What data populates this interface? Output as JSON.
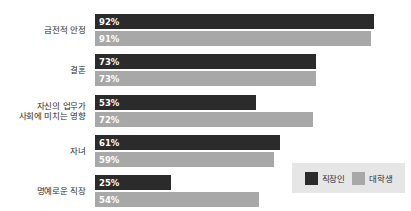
{
  "chart_data": {
    "type": "bar",
    "orientation": "horizontal",
    "title": "",
    "subtitle": "",
    "xlabel": "",
    "ylabel": "",
    "grid": false,
    "xlim": [
      0,
      100
    ],
    "legend_position": "bottom-right",
    "categories": [
      "금전적 안정",
      "자신의 업무가\n사회에 미치는 영향",
      "결혼",
      "자녀",
      "명예로운 직장"
    ],
    "series": [
      {
        "name": "직장인",
        "color": "#2b2b2b",
        "values": [
          92,
          53,
          73,
          61,
          25
        ]
      },
      {
        "name": "대학생",
        "color": "#a8a8a8",
        "values": [
          91,
          72,
          73,
          59,
          54
        ]
      }
    ]
  },
  "groups": [
    {
      "label_line1": "금전적 안정",
      "label_line2": "",
      "bars": [
        {
          "series": "직장인",
          "value": 92,
          "label": "92%",
          "color": "#2b2b2b",
          "text_color": "#ffffff"
        },
        {
          "series": "대학생",
          "value": 91,
          "label": "91%",
          "color": "#a8a8a8",
          "text_color": "#ffffff"
        }
      ]
    },
    {
      "label_line1": "결혼",
      "label_line2": "",
      "bars": [
        {
          "series": "직장인",
          "value": 73,
          "label": "73%",
          "color": "#2b2b2b",
          "text_color": "#ffffff"
        },
        {
          "series": "대학생",
          "value": 73,
          "label": "73%",
          "color": "#a8a8a8",
          "text_color": "#ffffff"
        }
      ]
    },
    {
      "label_line1": "자신의 업무가",
      "label_line2": "사회에 미치는 영향",
      "bars": [
        {
          "series": "직장인",
          "value": 53,
          "label": "53%",
          "color": "#2b2b2b",
          "text_color": "#ffffff"
        },
        {
          "series": "대학생",
          "value": 72,
          "label": "72%",
          "color": "#a8a8a8",
          "text_color": "#ffffff"
        }
      ]
    },
    {
      "label_line1": "자녀",
      "label_line2": "",
      "bars": [
        {
          "series": "직장인",
          "value": 61,
          "label": "61%",
          "color": "#2b2b2b",
          "text_color": "#ffffff"
        },
        {
          "series": "대학생",
          "value": 59,
          "label": "59%",
          "color": "#a8a8a8",
          "text_color": "#ffffff"
        }
      ]
    },
    {
      "label_line1": "명예로운 직장",
      "label_line2": "",
      "bars": [
        {
          "series": "직장인",
          "value": 25,
          "label": "25%",
          "color": "#2b2b2b",
          "text_color": "#ffffff"
        },
        {
          "series": "대학생",
          "value": 54,
          "label": "54%",
          "color": "#a8a8a8",
          "text_color": "#ffffff"
        }
      ]
    }
  ],
  "legend": {
    "background": "#e6e6e6",
    "items": [
      {
        "label": "직장인",
        "color": "#2b2b2b"
      },
      {
        "label": "대학생",
        "color": "#a8a8a8"
      }
    ]
  },
  "layout": {
    "plot_left_px": 95,
    "plot_width_px": 303,
    "group_tops_px": [
      14,
      54,
      95,
      135,
      175
    ],
    "bar_height_px": 15,
    "bar_gap_px": 2,
    "background": "#ffffff"
  }
}
